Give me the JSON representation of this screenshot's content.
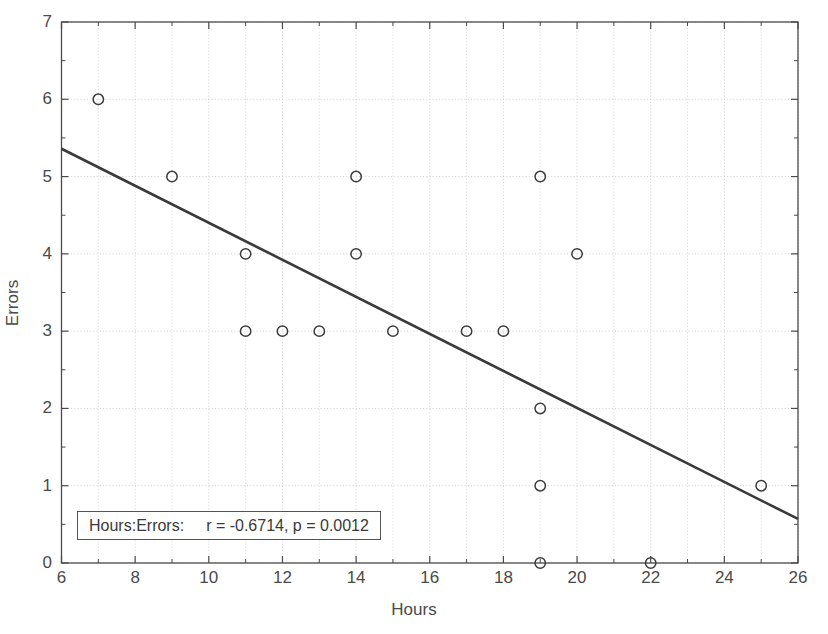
{
  "chart_data": {
    "type": "scatter",
    "title": "",
    "xlabel": "Hours",
    "ylabel": "Errors",
    "xlim": [
      6,
      26
    ],
    "ylim": [
      0,
      7
    ],
    "grid": true,
    "legend": "none",
    "x_ticks": [
      6,
      8,
      10,
      12,
      14,
      16,
      18,
      20,
      22,
      24,
      26
    ],
    "x_minor_ticks": [
      7,
      9,
      11,
      13,
      15,
      17,
      19,
      21,
      23,
      25
    ],
    "y_ticks": [
      0,
      1,
      2,
      3,
      4,
      5,
      6,
      7
    ],
    "x": [
      7,
      9,
      11,
      11,
      12,
      13,
      14,
      14,
      15,
      17,
      18,
      19,
      19,
      19,
      19,
      20,
      22,
      25
    ],
    "y": [
      6,
      5,
      4,
      3,
      3,
      3,
      5,
      4,
      3,
      3,
      3,
      5,
      2,
      1,
      0,
      4,
      0,
      1
    ],
    "points": [
      {
        "x": 7,
        "y": 6
      },
      {
        "x": 9,
        "y": 5
      },
      {
        "x": 11,
        "y": 4
      },
      {
        "x": 11,
        "y": 3
      },
      {
        "x": 12,
        "y": 3
      },
      {
        "x": 13,
        "y": 3
      },
      {
        "x": 14,
        "y": 5
      },
      {
        "x": 14,
        "y": 4
      },
      {
        "x": 15,
        "y": 3
      },
      {
        "x": 17,
        "y": 3
      },
      {
        "x": 18,
        "y": 3
      },
      {
        "x": 19,
        "y": 5
      },
      {
        "x": 19,
        "y": 2
      },
      {
        "x": 19,
        "y": 1
      },
      {
        "x": 19,
        "y": 0
      },
      {
        "x": 20,
        "y": 4
      },
      {
        "x": 22,
        "y": 0
      },
      {
        "x": 25,
        "y": 1
      }
    ],
    "marker": "open-circle",
    "marker_color": "#3c3c3c",
    "trendline": {
      "type": "linear-fit",
      "x0": 6,
      "y0": 5.36,
      "x1": 26,
      "y1": 0.57,
      "color": "#3a3a3a"
    },
    "annotation": {
      "pair_label": "Hours:Errors:",
      "stats": "r = -0.6714, p = 0.0012",
      "r": -0.6714,
      "p": 0.0012
    }
  },
  "axes": {
    "x_title": "Hours",
    "y_title": "Errors",
    "x_tick_labels": [
      "6",
      "8",
      "10",
      "12",
      "14",
      "16",
      "18",
      "20",
      "22",
      "24",
      "26"
    ],
    "y_tick_labels": [
      "0",
      "1",
      "2",
      "3",
      "4",
      "5",
      "6",
      "7"
    ]
  },
  "colors": {
    "axis": "#4a4a4a",
    "grid": "#d8d8d8",
    "marker": "#3c3c3c",
    "trendline": "#3a3a3a",
    "background": "#ffffff"
  }
}
